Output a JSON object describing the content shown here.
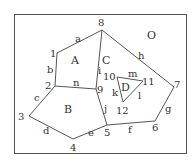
{
  "diagram": {
    "type": "planar-graph",
    "outer_region": "O",
    "frame": {
      "x": 14,
      "y": 14,
      "w": 172,
      "h": 139
    },
    "line_color": "#555555",
    "vertices": [
      {
        "id": "1",
        "x": 57,
        "y": 53,
        "lx": 50,
        "ly": 57
      },
      {
        "id": "2",
        "x": 55,
        "y": 86,
        "lx": 45,
        "ly": 89
      },
      {
        "id": "3",
        "x": 29,
        "y": 116,
        "lx": 18,
        "ly": 120
      },
      {
        "id": "4",
        "x": 73,
        "y": 139,
        "lx": 70,
        "ly": 151
      },
      {
        "id": "5",
        "x": 107,
        "y": 125,
        "lx": 104,
        "ly": 136
      },
      {
        "id": "6",
        "x": 155,
        "y": 121,
        "lx": 152,
        "ly": 131
      },
      {
        "id": "7",
        "x": 174,
        "y": 87,
        "lx": 174,
        "ly": 88
      },
      {
        "id": "8",
        "x": 102,
        "y": 30,
        "lx": 98,
        "ly": 26
      },
      {
        "id": "9",
        "x": 96,
        "y": 89,
        "lx": 97,
        "ly": 93
      },
      {
        "id": "10",
        "x": 117,
        "y": 77,
        "lx": 103,
        "ly": 80
      },
      {
        "id": "11",
        "x": 143,
        "y": 81,
        "lx": 142,
        "ly": 85
      },
      {
        "id": "12",
        "x": 123,
        "y": 102,
        "lx": 116,
        "ly": 114
      }
    ],
    "edges": [
      {
        "id": "a",
        "from": "1",
        "to": "8",
        "lx": 75,
        "ly": 42
      },
      {
        "id": "b",
        "from": "1",
        "to": "2",
        "lx": 47,
        "ly": 73
      },
      {
        "id": "c",
        "from": "2",
        "to": "3",
        "lx": 34,
        "ly": 101
      },
      {
        "id": "d",
        "from": "3",
        "to": "4",
        "lx": 43,
        "ly": 134
      },
      {
        "id": "e",
        "from": "4",
        "to": "5",
        "lx": 88,
        "ly": 136
      },
      {
        "id": "f",
        "from": "5",
        "to": "6",
        "lx": 128,
        "ly": 133
      },
      {
        "id": "g",
        "from": "6",
        "to": "7",
        "lx": 165,
        "ly": 112
      },
      {
        "id": "h",
        "from": "7",
        "to": "8",
        "lx": 138,
        "ly": 59
      },
      {
        "id": "i",
        "from": "8",
        "to": "9",
        "lx": 98,
        "ly": 74
      },
      {
        "id": "j",
        "from": "9",
        "to": "5",
        "lx": 104,
        "ly": 112
      },
      {
        "id": "n",
        "from": "2",
        "to": "9",
        "lx": 73,
        "ly": 86
      },
      {
        "id": "m",
        "from": "10",
        "to": "11",
        "lx": 128,
        "ly": 77
      },
      {
        "id": "l",
        "from": "11",
        "to": "12",
        "lx": 138,
        "ly": 99
      },
      {
        "id": "k",
        "from": "12",
        "to": "10",
        "lx": 112,
        "ly": 96
      }
    ],
    "regions": [
      {
        "id": "A",
        "lx": 71,
        "ly": 64
      },
      {
        "id": "B",
        "lx": 64,
        "ly": 113
      },
      {
        "id": "C",
        "lx": 102,
        "ly": 64
      },
      {
        "id": "D",
        "lx": 121,
        "ly": 91
      },
      {
        "id": "O",
        "lx": 147,
        "ly": 39
      }
    ]
  }
}
